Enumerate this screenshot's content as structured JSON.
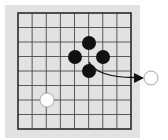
{
  "diagram": {
    "type": "go-board-capture-illustration",
    "colors": {
      "page_background": "#ffffff",
      "panel_background": "#e2e2e2",
      "grid_line": "#4a4a4a",
      "border_line": "#2a2a2a",
      "black_stone": "#111111",
      "white_stone": "#ffffff",
      "white_stone_edge": "#9a9a9a",
      "arrow": "#111111"
    },
    "panel": {
      "x": 5,
      "y": 5,
      "width": 135,
      "height": 133
    },
    "board": {
      "x0": 18,
      "y0": 13,
      "x1": 131,
      "y1": 129,
      "columns": 8,
      "rows": 8
    },
    "stones": [
      {
        "color": "black",
        "cx": 89,
        "cy": 43,
        "r": 7
      },
      {
        "color": "black",
        "cx": 75,
        "cy": 57,
        "r": 7
      },
      {
        "color": "black",
        "cx": 103,
        "cy": 57,
        "r": 7
      },
      {
        "color": "black",
        "cx": 89,
        "cy": 71,
        "r": 7
      },
      {
        "color": "white",
        "cx": 47,
        "cy": 100,
        "r": 7
      }
    ],
    "removed_stone": {
      "color": "white",
      "cx": 151,
      "cy": 78,
      "r": 7
    },
    "arrow": {
      "from": [
        89,
        62
      ],
      "control": [
        98,
        78
      ],
      "to": [
        144,
        78
      ]
    }
  }
}
